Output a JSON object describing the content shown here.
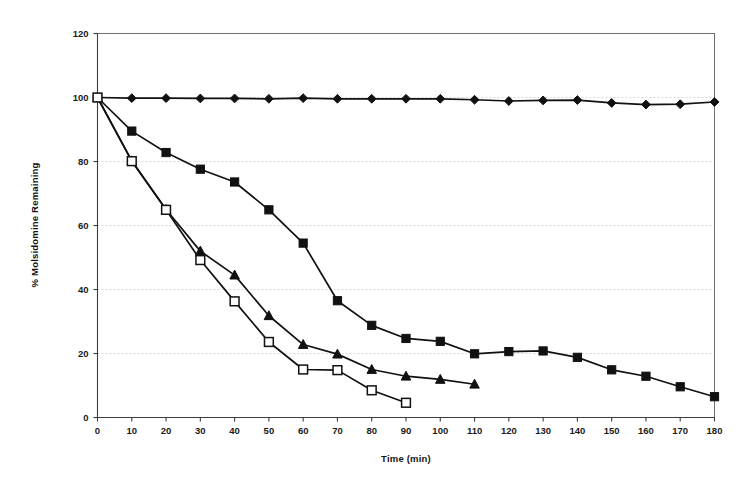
{
  "chart_data": {
    "type": "line",
    "title": "",
    "xlabel": "Time (min)",
    "ylabel": "% Molsidomine Remaining",
    "xlim": [
      0,
      180
    ],
    "ylim": [
      0,
      120
    ],
    "xticks": [
      0,
      10,
      20,
      30,
      40,
      50,
      60,
      70,
      80,
      90,
      100,
      110,
      120,
      130,
      140,
      150,
      160,
      170,
      180
    ],
    "yticks": [
      0,
      20,
      40,
      60,
      80,
      100,
      120
    ],
    "grid": true,
    "legend": "none",
    "series": [
      {
        "name": "series-diamond",
        "marker": "filled-diamond",
        "x": [
          0,
          10,
          20,
          30,
          40,
          50,
          60,
          70,
          80,
          90,
          100,
          110,
          120,
          130,
          140,
          150,
          160,
          170,
          180
        ],
        "values": [
          100,
          99.8,
          99.8,
          99.7,
          99.7,
          99.6,
          99.8,
          99.6,
          99.6,
          99.6,
          99.6,
          99.3,
          98.9,
          99.1,
          99.2,
          98.3,
          97.8,
          97.9,
          98.6
        ]
      },
      {
        "name": "series-filled-square",
        "marker": "filled-square",
        "x": [
          0,
          10,
          20,
          30,
          40,
          50,
          60,
          70,
          80,
          90,
          100,
          110,
          120,
          130,
          140,
          150,
          160,
          170,
          180
        ],
        "values": [
          100,
          89.5,
          82.8,
          77.6,
          73.6,
          64.9,
          54.5,
          36.5,
          28.8,
          24.7,
          23.8,
          19.9,
          20.6,
          20.8,
          18.8,
          14.9,
          12.9,
          9.6,
          6.5
        ]
      },
      {
        "name": "series-filled-triangle",
        "marker": "filled-triangle",
        "x": [
          0,
          10,
          20,
          30,
          40,
          50,
          60,
          70,
          80,
          90,
          100,
          110
        ],
        "values": [
          100,
          80.2,
          65.0,
          52.0,
          44.5,
          31.8,
          22.8,
          19.8,
          15.0,
          12.9,
          11.9,
          10.4
        ]
      },
      {
        "name": "series-open-square",
        "marker": "open-square",
        "x": [
          0,
          10,
          20,
          30,
          40,
          50,
          60,
          70,
          80,
          90
        ],
        "values": [
          100,
          80.1,
          64.9,
          49.2,
          36.3,
          23.6,
          15.0,
          14.8,
          8.5,
          4.6
        ]
      }
    ]
  },
  "axes": {
    "x_tick_labels": [
      "0",
      "10",
      "20",
      "30",
      "40",
      "50",
      "60",
      "70",
      "80",
      "90",
      "100",
      "110",
      "120",
      "130",
      "140",
      "150",
      "160",
      "170",
      "180"
    ],
    "y_tick_labels": [
      "0",
      "20",
      "40",
      "60",
      "80",
      "100",
      "120"
    ],
    "x_title": "Time (min)",
    "y_title": "% Molsidomine Remaining"
  },
  "colors": {
    "line": "#111111",
    "grid": "#c8c8c8",
    "border": "#6e6e6e",
    "text": "#1a1a1a",
    "background": "#ffffff"
  }
}
